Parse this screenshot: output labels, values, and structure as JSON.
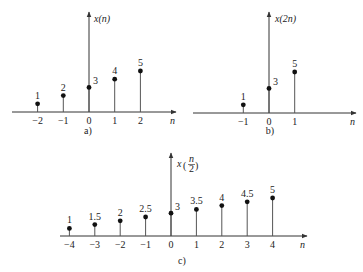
{
  "chart_data": [
    {
      "type": "stem",
      "panel_label": "a)",
      "ylabel": "x(n)",
      "xlabel": "n",
      "x": [
        -2,
        -1,
        0,
        1,
        2
      ],
      "values": [
        1,
        2,
        3,
        4,
        5
      ],
      "value_labels": [
        "1",
        "2",
        "3",
        "4",
        "5"
      ],
      "tick_labels": [
        "−2",
        "−1",
        "0",
        "1",
        "2"
      ],
      "grid": false
    },
    {
      "type": "stem",
      "panel_label": "b)",
      "ylabel": "x(2n)",
      "xlabel": "n",
      "x": [
        -1,
        0,
        1
      ],
      "values": [
        1,
        3,
        5
      ],
      "value_labels": [
        "1",
        "3",
        "5"
      ],
      "tick_labels": [
        "−1",
        "0",
        "1"
      ],
      "grid": false
    },
    {
      "type": "stem",
      "panel_label": "c)",
      "ylabel": "x(n/2)",
      "xlabel": "n",
      "x": [
        -4,
        -3,
        -2,
        -1,
        0,
        1,
        2,
        3,
        4
      ],
      "values": [
        1,
        1.5,
        2,
        2.5,
        3,
        3.5,
        4,
        4.5,
        5
      ],
      "value_labels": [
        "1",
        "1.5",
        "2",
        "2.5",
        "3",
        "3.5",
        "4",
        "4.5",
        "5"
      ],
      "tick_labels": [
        "−4",
        "−3",
        "−2",
        "−1",
        "0",
        "1",
        "2",
        "3",
        "4"
      ],
      "grid": false
    }
  ]
}
